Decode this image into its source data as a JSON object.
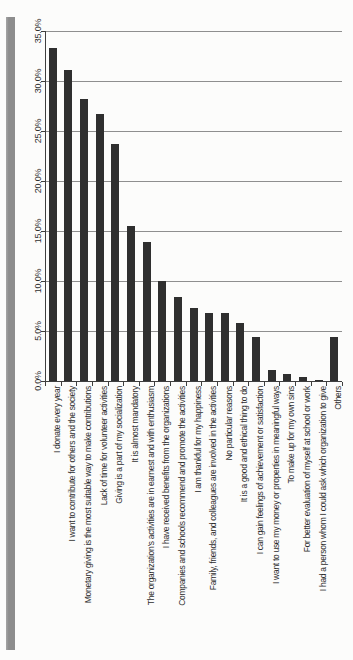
{
  "page": {
    "background_color": "#fcfcfb",
    "left_band_color": "#8d8d8d"
  },
  "chart_data": {
    "type": "bar",
    "title": "",
    "orientation": "vertical columns; all axis text rotated 90 degrees (reads bottom-to-top)",
    "legend_position": "none",
    "grid": true,
    "bar_color": "#2f2f2f",
    "gridline_color": "#8f8f8f",
    "axis_color": "#3f3f3f",
    "text_color": "#2e2e2e",
    "value_axis": {
      "min": 0,
      "max": 35,
      "step": 5,
      "ticks": [
        "0.0%",
        "5.0%",
        "10.0%",
        "15.0%",
        "20.0%",
        "25.0%",
        "30.0%",
        "35.0%"
      ]
    },
    "categories": [
      "I donate every year",
      "I want to contribute for others and the society",
      "Monetary giving is the most suitable way to make contributions",
      "Lack of time for volunteer activities",
      "Giving is a part of my socialization",
      "It is almost mandatory",
      "The organization's activities are in earnest and with enthusiasm",
      "I have received benefits from the organizations",
      "Companies and schools recommend and promote the activities",
      "I am thankful for my happiness",
      "Family, friends, and colleagues are involved in the activities",
      "No particular reasons",
      "It is a good and ethical thing to do",
      "I can gain feelings of achievement or satisfaction",
      "I want to use my money or properties in meaningful ways",
      "To make up for my own sins",
      "For better evaluation of myself at school or work",
      "I had a person whom I could ask which organization to give",
      "Others"
    ],
    "values": [
      33.3,
      31.1,
      28.2,
      26.7,
      23.7,
      15.5,
      13.9,
      10.0,
      8.4,
      7.3,
      6.8,
      6.8,
      5.8,
      4.4,
      1.1,
      0.7,
      0.4,
      0.1,
      4.4
    ],
    "values_unit": "%"
  }
}
